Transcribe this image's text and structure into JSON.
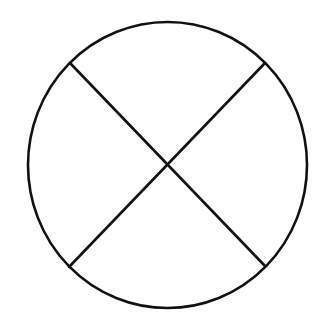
{
  "diagram": {
    "type": "circle-divided-by-diagonals",
    "background": "#ffffff",
    "stroke_color": "#111111",
    "stroke_width": 2.6,
    "circle": {
      "cx": 167.5,
      "cy": 165,
      "rx": 139.5,
      "ry": 143
    },
    "lines": [
      {
        "name": "diagonal-tl-br",
        "x1": 70,
        "y1": 63,
        "x2": 265,
        "y2": 266
      },
      {
        "name": "diagonal-tr-bl",
        "x1": 265,
        "y1": 63,
        "x2": 69,
        "y2": 267
      }
    ],
    "intersection": {
      "x": 167,
      "y": 165
    },
    "regions": [
      "top",
      "right",
      "bottom",
      "left"
    ]
  }
}
